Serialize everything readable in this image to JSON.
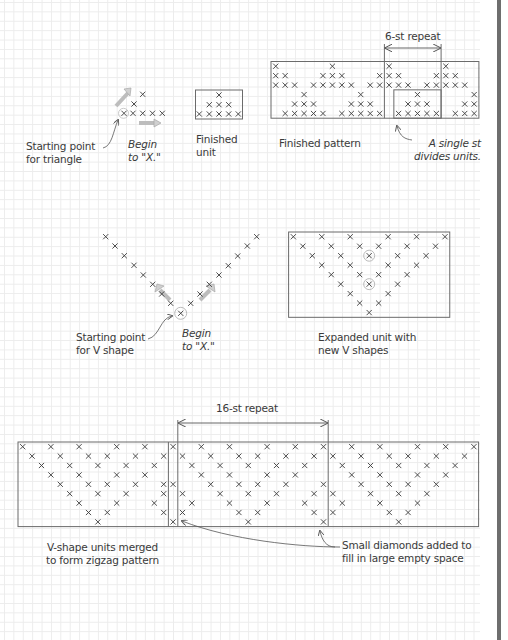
{
  "colors": {
    "line": "#6b6b6b",
    "stitch": "#3c3c3c",
    "arrow": "#b8b8b8",
    "grid": "#ececec",
    "bar": "#6e6e6e"
  },
  "section_triangle": {
    "start_label": "Starting point\nfor triangle",
    "begin_label": "Begin\nto \"X.\"",
    "unit_label": "Finished\nunit",
    "stitches": [
      [
        142.7,
        94.3
      ],
      [
        134,
        104
      ],
      [
        124,
        113.3
      ],
      [
        133,
        113.3
      ],
      [
        142.7,
        113.3
      ],
      [
        152.5,
        113.3
      ],
      [
        162.3,
        113.3
      ]
    ],
    "unit_box": {
      "x": 195.5,
      "y": 90,
      "w": 47,
      "h": 29
    },
    "unit_stitches": [
      [
        219,
        95
      ],
      [
        209.3,
        104.7
      ],
      [
        219,
        104.7
      ],
      [
        228.7,
        104.7
      ],
      [
        199.3,
        114
      ],
      [
        209.3,
        114
      ],
      [
        219,
        114
      ],
      [
        228.7,
        114
      ],
      [
        238.3,
        114
      ]
    ]
  },
  "section_finished_pattern": {
    "label": "Finished pattern",
    "repeat_label": "6-st repeat",
    "note_label": "A single st\ndivides units.",
    "box": {
      "x": 271,
      "y": 61.5,
      "cols": 22,
      "rows": 6,
      "cell": 9.45
    },
    "rows": [
      [
        0,
        6,
        12,
        18
      ],
      [
        0,
        1,
        5,
        6,
        7,
        11,
        12,
        13,
        17,
        18,
        19
      ],
      [
        0,
        1,
        2,
        4,
        5,
        6,
        7,
        8,
        10,
        11,
        12,
        13,
        14,
        16,
        17,
        18,
        19,
        20
      ],
      [
        3,
        9,
        15,
        21
      ],
      [
        2,
        3,
        4,
        8,
        9,
        10,
        14,
        15,
        16,
        20,
        21
      ],
      [
        1,
        2,
        3,
        4,
        5,
        7,
        8,
        9,
        10,
        11,
        13,
        14,
        15,
        16,
        17,
        19,
        20,
        21
      ]
    ],
    "repeat_cols": [
      12,
      18
    ],
    "inner_box_cols": [
      13,
      18
    ],
    "inner_box_rows": [
      3,
      6
    ]
  },
  "section_v_shape": {
    "start_label": "Starting point\nfor V shape",
    "begin_label": "Begin\nto \"X.\"",
    "stitches": [
      [
        105.7,
        236.7
      ],
      [
        115,
        246
      ],
      [
        124.3,
        255.7
      ],
      [
        134,
        265.3
      ],
      [
        143.3,
        275
      ],
      [
        152.7,
        284.3
      ],
      [
        161.7,
        294
      ],
      [
        170.7,
        303.3
      ],
      [
        190.7,
        303.3
      ],
      [
        200,
        294
      ],
      [
        209.3,
        284.3
      ],
      [
        219,
        275
      ],
      [
        228.3,
        265.7
      ],
      [
        237.7,
        256
      ],
      [
        247.3,
        246
      ],
      [
        256.7,
        236.7
      ]
    ],
    "start_stitch": [
      180.7,
      313.3
    ]
  },
  "section_expanded_unit": {
    "label": "Expanded unit with\nnew V shapes",
    "box": {
      "x": 288.6,
      "y": 232,
      "cols": 17,
      "rows": 9,
      "cell": 9.48
    },
    "rows": [
      [
        0,
        3,
        6,
        10,
        13,
        16
      ],
      [
        1,
        4,
        7,
        9,
        12,
        15
      ],
      [
        2,
        5,
        8,
        11,
        14
      ],
      [
        3,
        6,
        10,
        13
      ],
      [
        4,
        7,
        9,
        12
      ],
      [
        5,
        8,
        11
      ],
      [
        6,
        10
      ],
      [
        7,
        9
      ],
      [
        8
      ]
    ],
    "circled": [
      [
        2,
        8
      ],
      [
        5,
        8
      ]
    ]
  },
  "section_zigzag": {
    "label": "V-shape units merged\nto form zigzag pattern",
    "repeat_label": "16-st repeat",
    "note_label": "Small diamonds added to\nfill in large empty space",
    "box": {
      "x": 18,
      "y": 442,
      "cols": 49,
      "rows": 9,
      "cell": 9.4
    },
    "divider_col": 16,
    "repeat_cols": [
      17,
      33
    ],
    "rows": [
      [
        0,
        3,
        6,
        10,
        13,
        16,
        19,
        22,
        26,
        29,
        32,
        35,
        38,
        42,
        45,
        48
      ],
      [
        1,
        4,
        7,
        9,
        12,
        15,
        17,
        20,
        23,
        25,
        28,
        31,
        33,
        36,
        39,
        41,
        44,
        47
      ],
      [
        2,
        5,
        8,
        11,
        14,
        18,
        21,
        24,
        27,
        30,
        34,
        37,
        40,
        43,
        46
      ],
      [
        3,
        6,
        10,
        13,
        19,
        22,
        26,
        29,
        35,
        38,
        42,
        45
      ],
      [
        4,
        7,
        9,
        12,
        15,
        16,
        20,
        23,
        25,
        28,
        32,
        36,
        39,
        41,
        44
      ],
      [
        5,
        8,
        11,
        15,
        17,
        21,
        24,
        27,
        31,
        33,
        37,
        40,
        43
      ],
      [
        6,
        10,
        14,
        18,
        22,
        26,
        30,
        34,
        38,
        42
      ],
      [
        7,
        9,
        15,
        17,
        23,
        25,
        31,
        33,
        39,
        41
      ],
      [
        8,
        16,
        24,
        32,
        40
      ]
    ]
  }
}
